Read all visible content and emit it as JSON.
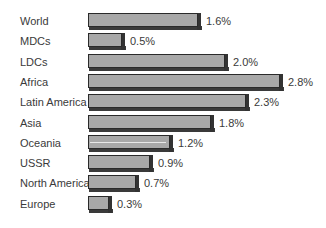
{
  "chart_data": {
    "type": "bar",
    "orientation": "horizontal",
    "title": "",
    "xlabel": "",
    "ylabel": "",
    "categories": [
      "World",
      "MDCs",
      "LDCs",
      "Africa",
      "Latin America",
      "Asia",
      "Oceania",
      "USSR",
      "North America",
      "Europe"
    ],
    "values": [
      1.6,
      0.5,
      2.0,
      2.8,
      2.3,
      1.8,
      1.2,
      0.9,
      0.7,
      0.3
    ],
    "value_labels": [
      "1.6%",
      "0.5%",
      "2.0%",
      "2.8%",
      "2.3%",
      "1.8%",
      "1.2%",
      "0.9%",
      "0.7%",
      "0.3%"
    ],
    "unit": "%",
    "grid": false,
    "legend": null,
    "style": "3d-shadowed gray bars",
    "colors": {
      "bar_face": "#a8a8a8",
      "bar_shadow": "#333333",
      "text": "#3a3a3a"
    }
  }
}
